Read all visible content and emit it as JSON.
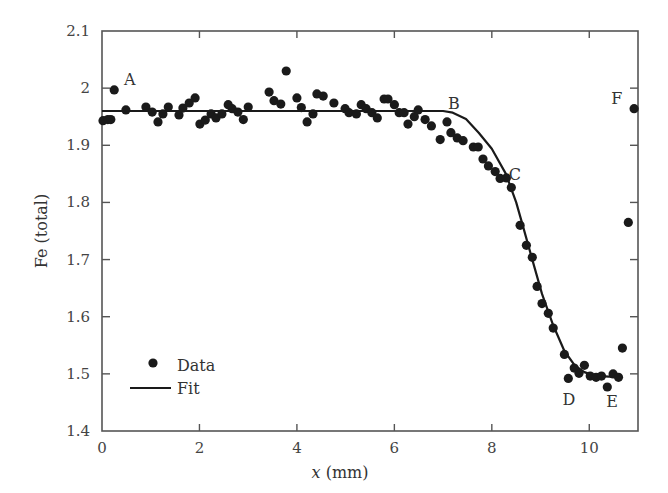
{
  "chart_data": {
    "type": "scatter",
    "title": "",
    "xlabel_var": "x",
    "xlabel_unit": " (mm)",
    "xlabel": "x (mm)",
    "ylabel": "Fe (total)",
    "xlim": [
      0,
      11
    ],
    "ylim": [
      1.4,
      2.1
    ],
    "xticks": [
      0,
      2,
      4,
      6,
      8,
      10
    ],
    "xtick_labels": [
      "0",
      "2",
      "4",
      "6",
      "8",
      "10"
    ],
    "yticks": [
      1.4,
      1.5,
      1.6,
      1.7,
      1.8,
      1.9,
      2.0,
      2.1
    ],
    "ytick_labels": [
      "1.4",
      "1.5",
      "1.6",
      "1.7",
      "1.8",
      "1.9",
      "2",
      "2.1"
    ],
    "grid": false,
    "legend_position": "lower left",
    "legend": [
      {
        "label": "Data",
        "kind": "marker"
      },
      {
        "label": "Fit",
        "kind": "line"
      }
    ],
    "series": [
      {
        "name": "Data",
        "kind": "scatter",
        "color": "#1a1a1a",
        "points": [
          [
            0.02,
            1.943
          ],
          [
            0.12,
            1.945
          ],
          [
            0.18,
            1.945
          ],
          [
            0.25,
            1.997
          ],
          [
            0.49,
            1.962
          ],
          [
            0.9,
            1.967
          ],
          [
            1.03,
            1.958
          ],
          [
            1.15,
            1.941
          ],
          [
            1.25,
            1.955
          ],
          [
            1.36,
            1.967
          ],
          [
            1.58,
            1.953
          ],
          [
            1.66,
            1.965
          ],
          [
            1.79,
            1.974
          ],
          [
            1.91,
            1.983
          ],
          [
            2.01,
            1.937
          ],
          [
            2.12,
            1.944
          ],
          [
            2.24,
            1.955
          ],
          [
            2.34,
            1.948
          ],
          [
            2.46,
            1.955
          ],
          [
            2.59,
            1.971
          ],
          [
            2.67,
            1.964
          ],
          [
            2.79,
            1.958
          ],
          [
            2.9,
            1.945
          ],
          [
            3.0,
            1.967
          ],
          [
            3.43,
            1.993
          ],
          [
            3.53,
            1.978
          ],
          [
            3.67,
            1.972
          ],
          [
            3.78,
            2.03
          ],
          [
            4.0,
            1.983
          ],
          [
            4.09,
            1.966
          ],
          [
            4.21,
            1.941
          ],
          [
            4.33,
            1.955
          ],
          [
            4.41,
            1.99
          ],
          [
            4.54,
            1.986
          ],
          [
            4.76,
            1.974
          ],
          [
            4.99,
            1.964
          ],
          [
            5.07,
            1.957
          ],
          [
            5.22,
            1.955
          ],
          [
            5.32,
            1.971
          ],
          [
            5.42,
            1.964
          ],
          [
            5.54,
            1.957
          ],
          [
            5.65,
            1.948
          ],
          [
            5.79,
            1.981
          ],
          [
            5.87,
            1.981
          ],
          [
            6.0,
            1.971
          ],
          [
            6.1,
            1.957
          ],
          [
            6.2,
            1.957
          ],
          [
            6.28,
            1.937
          ],
          [
            6.41,
            1.95
          ],
          [
            6.49,
            1.962
          ],
          [
            6.63,
            1.945
          ],
          [
            6.76,
            1.934
          ],
          [
            6.94,
            1.91
          ],
          [
            7.08,
            1.941
          ],
          [
            7.16,
            1.922
          ],
          [
            7.29,
            1.913
          ],
          [
            7.41,
            1.908
          ],
          [
            7.62,
            1.897
          ],
          [
            7.72,
            1.897
          ],
          [
            7.82,
            1.876
          ],
          [
            7.93,
            1.864
          ],
          [
            8.07,
            1.854
          ],
          [
            8.17,
            1.842
          ],
          [
            8.3,
            1.843
          ],
          [
            8.4,
            1.826
          ],
          [
            8.58,
            1.76
          ],
          [
            8.71,
            1.725
          ],
          [
            8.83,
            1.704
          ],
          [
            8.93,
            1.653
          ],
          [
            9.03,
            1.623
          ],
          [
            9.16,
            1.606
          ],
          [
            9.26,
            1.58
          ],
          [
            9.49,
            1.534
          ],
          [
            9.57,
            1.492
          ],
          [
            9.69,
            1.51
          ],
          [
            9.79,
            1.501
          ],
          [
            9.9,
            1.515
          ],
          [
            10.02,
            1.496
          ],
          [
            10.14,
            1.494
          ],
          [
            10.25,
            1.496
          ],
          [
            10.37,
            1.477
          ],
          [
            10.49,
            1.5
          ],
          [
            10.6,
            1.494
          ],
          [
            10.68,
            1.545
          ],
          [
            10.8,
            1.765
          ],
          [
            10.92,
            1.964
          ]
        ]
      },
      {
        "name": "Fit",
        "kind": "line",
        "color": "#1a1a1a",
        "points": [
          [
            0.0,
            1.96
          ],
          [
            7.0,
            1.96
          ],
          [
            7.2,
            1.957
          ],
          [
            7.47,
            1.946
          ],
          [
            7.73,
            1.922
          ],
          [
            8.0,
            1.894
          ],
          [
            8.29,
            1.85
          ],
          [
            8.5,
            1.8
          ],
          [
            8.65,
            1.755
          ],
          [
            8.83,
            1.7
          ],
          [
            9.03,
            1.64
          ],
          [
            9.26,
            1.585
          ],
          [
            9.49,
            1.54
          ],
          [
            9.7,
            1.515
          ],
          [
            9.9,
            1.503
          ],
          [
            10.1,
            1.497
          ],
          [
            10.4,
            1.495
          ],
          [
            10.6,
            1.495
          ]
        ]
      }
    ],
    "annotations": [
      {
        "text": "A",
        "x": 0.45,
        "y": 2.005
      },
      {
        "text": "B",
        "x": 7.1,
        "y": 1.963
      },
      {
        "text": "C",
        "x": 8.35,
        "y": 1.84
      },
      {
        "text": "D",
        "x": 9.45,
        "y": 1.445
      },
      {
        "text": "E",
        "x": 10.35,
        "y": 1.442
      },
      {
        "text": "F",
        "x": 10.45,
        "y": 1.973
      }
    ]
  },
  "plot_area": {
    "left": 102,
    "top": 31,
    "right": 638,
    "bottom": 431
  }
}
